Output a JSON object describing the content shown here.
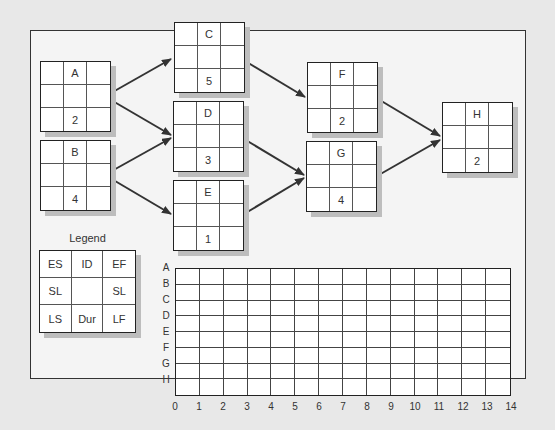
{
  "diagram": {
    "type": "activity-on-node network",
    "nodes": [
      {
        "id": "A",
        "duration": "2",
        "x": 40,
        "y": 61
      },
      {
        "id": "B",
        "duration": "4",
        "x": 40,
        "y": 140
      },
      {
        "id": "C",
        "duration": "5",
        "x": 174,
        "y": 22
      },
      {
        "id": "D",
        "duration": "3",
        "x": 173,
        "y": 101
      },
      {
        "id": "E",
        "duration": "1",
        "x": 173,
        "y": 180
      },
      {
        "id": "F",
        "duration": "2",
        "x": 307,
        "y": 62
      },
      {
        "id": "G",
        "duration": "4",
        "x": 306,
        "y": 141
      },
      {
        "id": "H",
        "duration": "2",
        "x": 442,
        "y": 102
      }
    ],
    "edges": [
      {
        "from": "A",
        "to": "C"
      },
      {
        "from": "A",
        "to": "D"
      },
      {
        "from": "B",
        "to": "D"
      },
      {
        "from": "B",
        "to": "E"
      },
      {
        "from": "C",
        "to": "F"
      },
      {
        "from": "D",
        "to": "G"
      },
      {
        "from": "E",
        "to": "G"
      },
      {
        "from": "F",
        "to": "H"
      },
      {
        "from": "G",
        "to": "H"
      }
    ]
  },
  "legend": {
    "title": "Legend",
    "cells": [
      "ES",
      "ID",
      "EF",
      "SL",
      "",
      "SL",
      "LS",
      "Dur",
      "LF"
    ]
  },
  "gantt": {
    "rows": [
      "A",
      "B",
      "C",
      "D",
      "E",
      "F",
      "G",
      "H"
    ],
    "x_ticks": [
      "0",
      "1",
      "2",
      "3",
      "4",
      "5",
      "6",
      "7",
      "8",
      "9",
      "10",
      "11",
      "12",
      "13",
      "14"
    ]
  }
}
